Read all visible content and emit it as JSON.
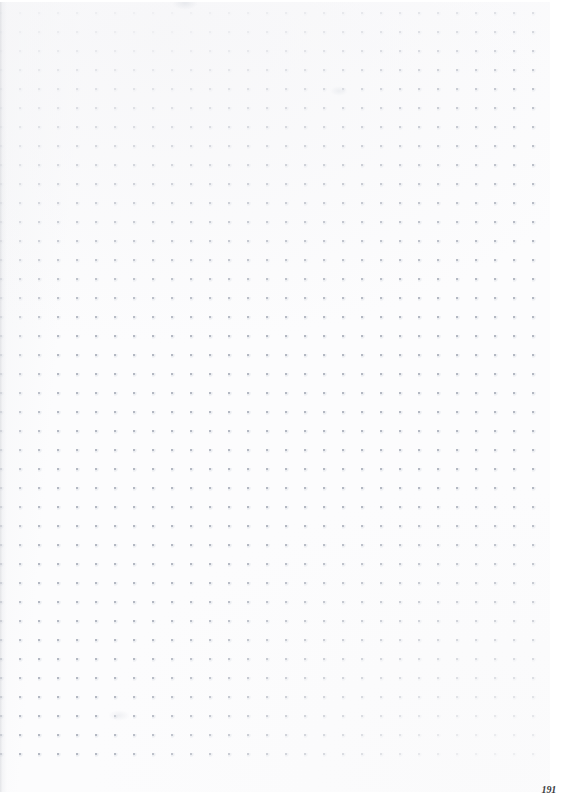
{
  "document": {
    "kind": "dot-grid-notebook-page-scan",
    "page_number": "191"
  },
  "canvas": {
    "width_px": 562,
    "height_px": 808
  },
  "paper": {
    "background_color": "#fcfcfd",
    "trim_color": "#ffffff",
    "binding_shadow_color": "#cdcfd4"
  },
  "grid": {
    "style": "dot",
    "spacing_px": 19,
    "origin_x_px": 1,
    "origin_y_px": 13,
    "columns": 29,
    "rows": 41,
    "dot_color": "#b0b5c0",
    "dot_halo_color": "#c6cbd6",
    "dot_size_px": 2
  },
  "marks": {
    "smudge_count": 3
  }
}
